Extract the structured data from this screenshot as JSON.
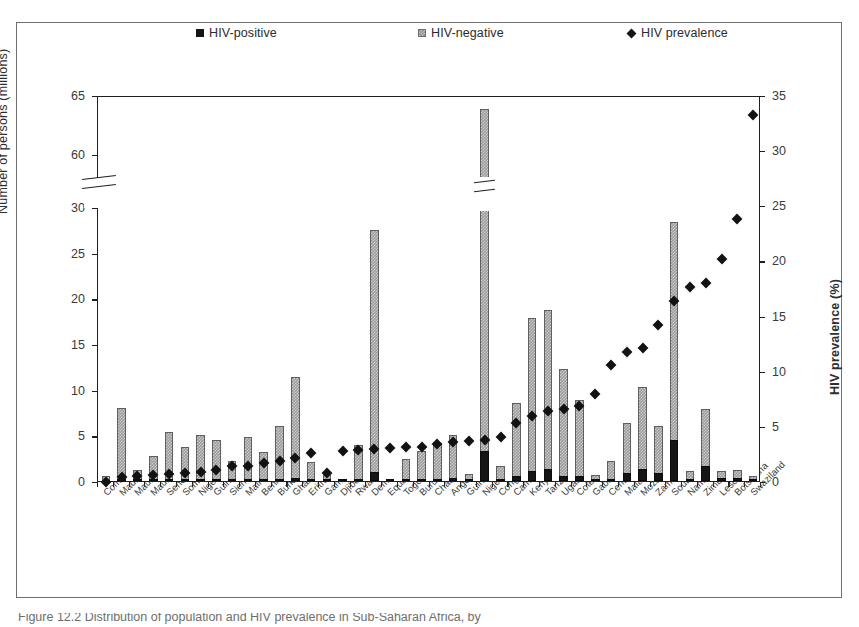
{
  "figure": {
    "caption": "Figure 12.2   Distribution of population and HIV prevalence in Sub-Saharan Africa, by",
    "axis_break_label": "axis-break"
  },
  "legend": {
    "position": "top",
    "items": [
      {
        "label": "HIV-positive",
        "marker": "filled-square",
        "color": "#151515"
      },
      {
        "label": "HIV-negative",
        "marker": "hatched-square",
        "color": "#9a9a9a"
      },
      {
        "label": "HIV prevalence",
        "marker": "filled-diamond",
        "color": "#121212"
      }
    ]
  },
  "axes": {
    "left": {
      "title": "Number of persons (millions)",
      "ticks": [
        0,
        5,
        10,
        15,
        20,
        25,
        30,
        60,
        65
      ],
      "broken_between": [
        30,
        60
      ]
    },
    "right": {
      "title": "HIV prevalence (%)",
      "ticks": [
        0,
        5,
        10,
        15,
        20,
        25,
        30,
        35
      ]
    }
  },
  "chart_data": {
    "type": "bar",
    "title": "",
    "subtitle": "",
    "xlabel": "",
    "ylabel": "Number of persons (millions)",
    "y2label": "HIV prevalence (%)",
    "ylim": [
      0,
      65
    ],
    "y2lim": [
      0,
      35
    ],
    "grid": false,
    "legend_position": "top",
    "stacked": true,
    "axis_break": {
      "from": 30,
      "to": 58
    },
    "categories": [
      "Comoros",
      "Madagascar",
      "Mauritius",
      "Mauritania",
      "Senegal",
      "Somalia",
      "Niger",
      "Guinea",
      "Sierra Leone",
      "Mali",
      "Benin",
      "Burkina Faso",
      "Ghana",
      "Eritrea",
      "Gambia",
      "Djibouti",
      "Rwanda",
      "Dem. Rep. of the Congo",
      "Equatorial Guinea",
      "Togo",
      "Burundi",
      "Chad",
      "Angola",
      "Guinea-Bissau",
      "Nigeria",
      "Congo",
      "Cameroon",
      "Kenya",
      "Tanzania",
      "Uganda",
      "Cote d'Ivoire",
      "Gabon",
      "Central African Republic",
      "Malawi",
      "Mozambique",
      "Zambia",
      "South Africa",
      "Namibia",
      "Zimbabwe",
      "Lesotho",
      "Botswana",
      "Swaziland"
    ],
    "series": [
      {
        "name": "HIV-negative",
        "unit": "millions",
        "values": [
          0.6,
          8.0,
          1.2,
          2.7,
          5.4,
          3.7,
          5.0,
          4.4,
          2.1,
          4.7,
          3.1,
          5.8,
          11.0,
          2.0,
          0.7,
          0.1,
          3.8,
          26.5,
          0.2,
          2.3,
          3.0,
          4.0,
          4.7,
          0.7,
          60.5,
          1.6,
          8.0,
          16.8,
          17.4,
          11.8,
          8.3,
          0.6,
          1.9,
          5.4,
          9.0,
          5.1,
          23.9,
          0.9,
          6.2,
          0.8,
          0.9,
          0.3
        ]
      },
      {
        "name": "HIV-positive",
        "unit": "millions",
        "values": [
          0.0,
          0.03,
          0.01,
          0.01,
          0.02,
          0.04,
          0.03,
          0.05,
          0.04,
          0.07,
          0.08,
          0.18,
          0.35,
          0.06,
          0.01,
          0.01,
          0.19,
          1.0,
          0.01,
          0.11,
          0.25,
          0.2,
          0.35,
          0.02,
          3.3,
          0.09,
          0.52,
          1.1,
          1.3,
          0.5,
          0.55,
          0.02,
          0.24,
          0.9,
          1.3,
          0.92,
          4.5,
          0.21,
          1.65,
          0.3,
          0.34,
          0.22
        ]
      }
    ],
    "prevalence": {
      "name": "HIV prevalence",
      "unit": "%",
      "values": [
        0.1,
        0.5,
        0.6,
        0.7,
        0.8,
        0.9,
        1.0,
        1.2,
        1.5,
        1.5,
        1.8,
        2.0,
        2.3,
        2.7,
        0.9,
        2.9,
        3.0,
        3.1,
        3.2,
        3.3,
        3.3,
        3.5,
        3.7,
        3.8,
        3.9,
        4.2,
        5.4,
        6.1,
        6.5,
        6.7,
        7.0,
        8.1,
        10.7,
        11.9,
        12.2,
        14.3,
        16.5,
        17.8,
        18.1,
        20.3,
        23.9,
        33.4
      ]
    }
  }
}
